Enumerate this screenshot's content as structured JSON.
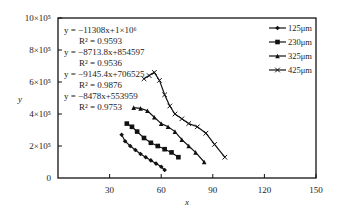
{
  "chart_data": {
    "type": "scatter",
    "title": "",
    "xlabel": "x",
    "ylabel": "y",
    "xlim": [
      0,
      150
    ],
    "ylim": [
      0,
      1000000
    ],
    "x_ticks": [
      "30",
      "60",
      "90",
      "120",
      "150"
    ],
    "y_ticks": [
      "0",
      "2×10⁵",
      "4×10⁵",
      "6×10⁵",
      "8×10⁵",
      "10×10⁵"
    ],
    "grid": false,
    "legend_position": "upper right",
    "annotations": [
      {
        "equation": "y = −11308x+1×10⁶",
        "r2": "R² = 0.9593"
      },
      {
        "equation": "y = −8713.8x+854597",
        "r2": "R² = 0.9536"
      },
      {
        "equation": "y = −9145.4x+706525",
        "r2": "R² = 0.9876"
      },
      {
        "equation": "y = −8478x+553959",
        "r2": "R² = 0.9753"
      }
    ],
    "series": [
      {
        "name": "125μm",
        "marker": "diamond",
        "x": [
          37,
          39,
          42,
          45,
          48,
          51,
          54,
          57,
          60,
          62
        ],
        "y": [
          270000,
          230000,
          200000,
          175000,
          150000,
          130000,
          110000,
          90000,
          70000,
          50000
        ]
      },
      {
        "name": "230μm",
        "marker": "square",
        "x": [
          40,
          43,
          46,
          50,
          54,
          58,
          62,
          66,
          70
        ],
        "y": [
          340000,
          320000,
          290000,
          250000,
          220000,
          200000,
          180000,
          160000,
          130000
        ]
      },
      {
        "name": "325μm",
        "marker": "triangle",
        "x": [
          44,
          48,
          52,
          56,
          60,
          64,
          68,
          72,
          76,
          80,
          85
        ],
        "y": [
          440000,
          435000,
          420000,
          380000,
          340000,
          320000,
          290000,
          240000,
          200000,
          160000,
          100000
        ]
      },
      {
        "name": "425μm",
        "marker": "x",
        "x": [
          50,
          53,
          56,
          59,
          62,
          65,
          68,
          72,
          76,
          81,
          86,
          91,
          97
        ],
        "y": [
          620000,
          640000,
          660000,
          610000,
          520000,
          450000,
          400000,
          370000,
          340000,
          320000,
          280000,
          210000,
          130000
        ]
      }
    ]
  }
}
